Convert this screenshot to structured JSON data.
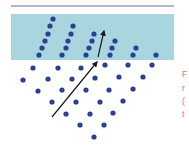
{
  "diagram": {
    "type": "wave-refraction",
    "colors": {
      "top_rule": "#6a6f8a",
      "medium": "#a9d5df",
      "dot": "#2b3f94",
      "arrow": "#1b1b22",
      "caption": "#e07a5f"
    },
    "top_rule": {
      "x1": 11,
      "x2": 174,
      "y": 6
    },
    "medium": {
      "x": 11,
      "y": 14,
      "width": 163,
      "height": 46
    },
    "dots_in_medium": [
      [
        53,
        19
      ],
      [
        50,
        26
      ],
      [
        48,
        34
      ],
      [
        45,
        41
      ],
      [
        42,
        48
      ],
      [
        39,
        55
      ],
      [
        73,
        26
      ],
      [
        71,
        34
      ],
      [
        68,
        41
      ],
      [
        66,
        48
      ],
      [
        62,
        55
      ],
      [
        94,
        34
      ],
      [
        92,
        41
      ],
      [
        89,
        48
      ],
      [
        86,
        55
      ],
      [
        115,
        41
      ],
      [
        112,
        48
      ],
      [
        110,
        55
      ],
      [
        136,
        48
      ],
      [
        133,
        55
      ],
      [
        156,
        55
      ]
    ],
    "dots_below": [
      [
        33,
        68
      ],
      [
        58,
        68
      ],
      [
        81,
        68
      ],
      [
        105,
        65
      ],
      [
        128,
        65
      ],
      [
        152,
        65
      ],
      [
        23,
        80
      ],
      [
        48,
        79
      ],
      [
        72,
        79
      ],
      [
        95,
        78
      ],
      [
        119,
        77
      ],
      [
        143,
        77
      ],
      [
        38,
        91
      ],
      [
        62,
        90
      ],
      [
        86,
        90
      ],
      [
        109,
        90
      ],
      [
        133,
        89
      ],
      [
        52,
        102
      ],
      [
        76,
        102
      ],
      [
        100,
        102
      ],
      [
        123,
        101
      ],
      [
        66,
        114
      ],
      [
        90,
        114
      ],
      [
        113,
        113
      ],
      [
        80,
        125
      ],
      [
        104,
        125
      ],
      [
        94,
        137
      ]
    ],
    "incident_arrow": {
      "x1": 52,
      "y1": 117,
      "x2": 97,
      "y2": 62
    },
    "refracted_arrow": {
      "x1": 98,
      "y1": 57,
      "x2": 104,
      "y2": 31
    }
  },
  "caption": {
    "lines": [
      "F",
      "r",
      "(",
      "t"
    ]
  }
}
